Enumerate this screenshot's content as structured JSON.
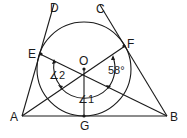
{
  "diagram": {
    "type": "geometry",
    "points": {
      "A": {
        "label": "A"
      },
      "B": {
        "label": "B"
      },
      "C": {
        "label": "C"
      },
      "D": {
        "label": "D"
      },
      "E": {
        "label": "E"
      },
      "F": {
        "label": "F"
      },
      "G": {
        "label": "G"
      },
      "O": {
        "label": "O"
      }
    },
    "angles": {
      "angle1": "∠1",
      "angle2": "∠2",
      "given": "58°"
    },
    "colors": {
      "stroke": "#1a1a1a",
      "background": "#ffffff"
    }
  }
}
